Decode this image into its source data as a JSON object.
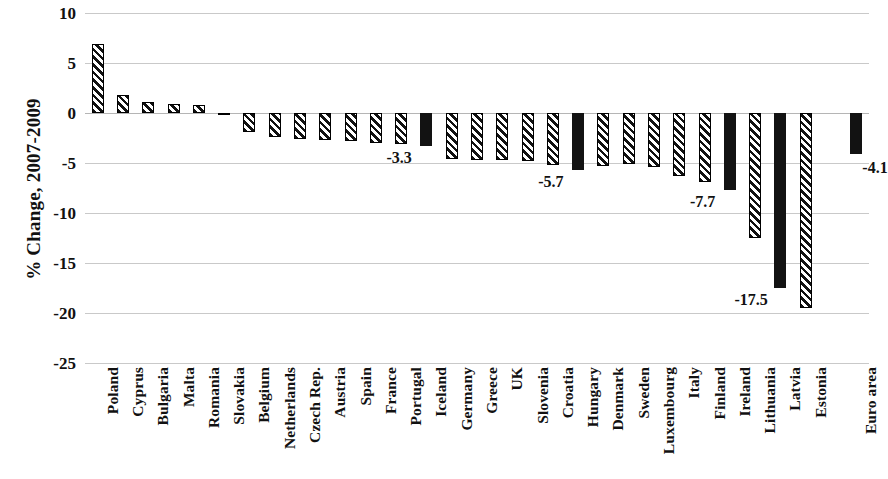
{
  "chart_data": {
    "type": "bar",
    "title": "",
    "xlabel": "",
    "ylabel": "% Change, 2007-2009",
    "ylim": [
      -25,
      10
    ],
    "yticks": [
      10,
      5,
      0,
      -5,
      -10,
      -15,
      -20,
      -25
    ],
    "ytick_labels": [
      "10",
      "5",
      "0",
      "-5",
      "-10",
      "-15",
      "-20",
      "-25"
    ],
    "grid": true,
    "legend": "none",
    "categories": [
      "Poland",
      "Cyprus",
      "Bulgaria",
      "Malta",
      "Romania",
      "Slovakia",
      "Belgium",
      "Netherlands",
      "Czech Rep.",
      "Austria",
      "Spain",
      "France",
      "Portugal",
      "Iceland",
      "Germany",
      "Greece",
      "UK",
      "Slovenia",
      "Croatia",
      "Hungary",
      "Denmark",
      "Sweden",
      "Luxembourg",
      "Italy",
      "Finland",
      "Ireland",
      "Lithuania",
      "Latvia",
      "Estonia",
      "Euro area"
    ],
    "values": [
      6.9,
      1.8,
      1.1,
      0.9,
      0.8,
      -0.2,
      -1.9,
      -2.4,
      -2.6,
      -2.7,
      -2.8,
      -3.0,
      -3.1,
      -3.3,
      -4.6,
      -4.7,
      -4.7,
      -4.8,
      -5.2,
      -5.7,
      -5.3,
      -5.1,
      -5.4,
      -6.3,
      -6.9,
      -7.7,
      -12.5,
      -17.5,
      -19.5,
      -4.1
    ],
    "highlighted": [
      "Iceland",
      "Hungary",
      "Ireland",
      "Latvia",
      "Euro area"
    ],
    "data_labels": [
      {
        "category": "Iceland",
        "text": "-3.3"
      },
      {
        "category": "Hungary",
        "text": "-5.7"
      },
      {
        "category": "Ireland",
        "text": "-7.7"
      },
      {
        "category": "Latvia",
        "text": "-17.5"
      },
      {
        "category": "Euro area",
        "text": "-4.1"
      }
    ],
    "styles": {
      "bar_hatch_color": "#111111",
      "bar_hatch_background": "#ffffff",
      "bar_solid_color": "#121212",
      "gridline_color": "#c9c9c9",
      "text_color": "#111111"
    }
  }
}
